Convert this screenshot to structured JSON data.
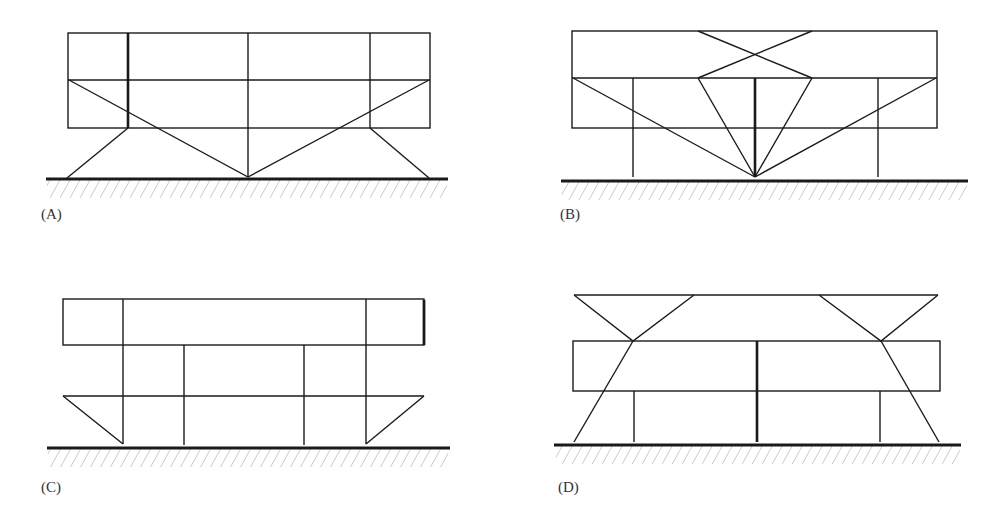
{
  "figure": {
    "panels": [
      {
        "id": "A",
        "label": "(A)"
      },
      {
        "id": "B",
        "label": "(B)"
      },
      {
        "id": "C",
        "label": "(C)"
      },
      {
        "id": "D",
        "label": "(D)"
      }
    ]
  },
  "colors": {
    "line": "#1a1a1a",
    "hatch": "#bdbdbd",
    "background": "#ffffff"
  }
}
